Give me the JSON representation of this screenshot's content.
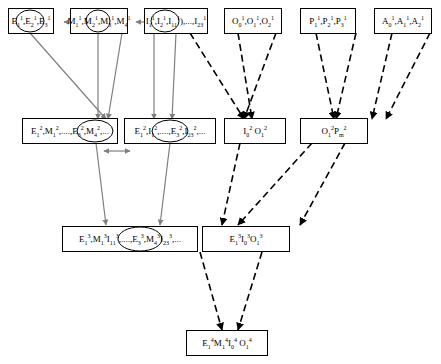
{
  "diagram": {
    "title": "",
    "nodes": [
      {
        "id": "n-e1",
        "label": "E₁¹,E₂¹,E₃¹",
        "html": "E<sub>1</sub><sup>1</sup>,E<sub>2</sub><sup>1</sup>,E<sub>3</sub><sup>1</sup>"
      },
      {
        "id": "n-m1",
        "label": "M₁¹,M₂¹,M₃¹,M₄¹",
        "html": "M<sub>1</sub><sup>1</sup>,M<sub>2</sub><sup>1</sup>,M<sub>3</sub><sup>1</sup>,M<sub>4</sub><sup>1</sup>"
      },
      {
        "id": "n-i1",
        "label": "I₁¹,I₂¹,I₁₁¹,...,I₂₃¹",
        "html": "I<sub>1</sub><sup>1</sup>,I<sub>2</sub><sup>1</sup>,I<sub>11</sub><sup>1</sup>),...,I<sub>23</sub><sup>1</sup>"
      },
      {
        "id": "n-o1",
        "label": "O₁¹,O₁¹,O₂¹",
        "html": "O<sub>0</sub><sup>1</sup>,O<sub>1</sub><sup>1</sup>,O<sub>2</sub><sup>1</sup>"
      },
      {
        "id": "n-p1",
        "label": "P₁¹,P₂¹,P₃¹",
        "html": "P<sub>1</sub><sup>1</sup>,P<sub>2</sub><sup>1</sup>,P<sub>3</sub><sup>1</sup>"
      },
      {
        "id": "n-a1",
        "label": "A₀¹,A₁¹,A₂¹",
        "html": "A<sub>0</sub><sup>1</sup>,A<sub>1</sub><sup>1</sup>,A<sub>2</sub><sup>1</sup>"
      },
      {
        "id": "n-em2",
        "label": "E₁²,M₁²,....,E₃²,M₄²,...",
        "html": "E<sub>1</sub><sup>2</sup>,M<sub>1</sub><sup>2</sup>,....,E<sub>3</sub><sup>2</sup>,M<sub>4</sub><sup>2</sup>,..."
      },
      {
        "id": "n-ei2",
        "label": "E₁²,I₁²,....,E₃²,I₂₃²,...",
        "html": "E<sub>1</sub><sup>2</sup>,I<sub>1</sub><sup>2</sup>,....,E<sub>3</sub><sup>2</sup>,I<sub>23</sub><sup>2</sup>,..."
      },
      {
        "id": "n-io2",
        "label": "I₀² O₁²",
        "html": "I<sub>0</sub><sup>2</sup> O<sub>1</sub><sup>2</sup>"
      },
      {
        "id": "n-op2",
        "label": "O₁² P_m²",
        "html": "O<sub>1</sub><sup>2</sup>P<sub>m</sub><sup>2</sup>"
      },
      {
        "id": "n-emi3",
        "label": "E₁³,M₁³I₁₁³,....,E₃³,M₄³I₂₃³,...",
        "html": "E<sub>1</sub><sup>3</sup>,M<sub>1</sub><sup>3</sup>I<sub>11</sub><sup>3</sup>,....,E<sub>3</sub><sup>3</sup>,M<sub>4</sub><sup>3</sup>I<sub>23</sub><sup>3</sup>,..."
      },
      {
        "id": "n-eio3",
        "label": "E₁³I₁³O₁³",
        "html": "E<sub>1</sub><sup>3</sup>I<sub>0</sub><sup>3</sup>O<sub>1</sub><sup>3</sup>"
      },
      {
        "id": "n-emio4",
        "label": "E₁⁴M₁⁴I₀⁴O₁⁴",
        "html": "E<sub>1</sub><sup>4</sup>M<sub>1</sub><sup>4</sup>I<sub>0</sub><sup>4</sup> O<sub>1</sub><sup>4</sup>"
      }
    ],
    "edge_styles": {
      "solid": "#808080",
      "dashed": "#000000"
    }
  }
}
